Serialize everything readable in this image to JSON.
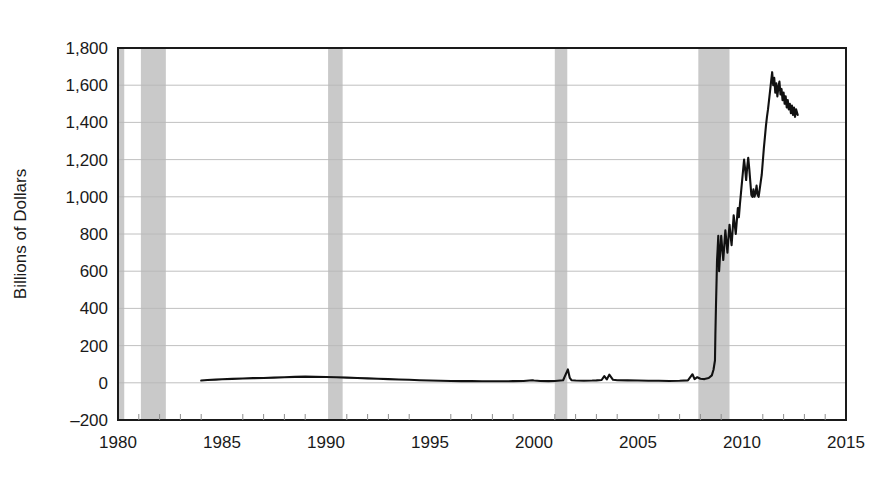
{
  "figure": {
    "name": "excess-reserves-time-series",
    "background_color": "#ffffff"
  },
  "chart_data": {
    "type": "line",
    "title": "",
    "subtitle": "",
    "xlabel": "",
    "ylabel": "Billions of Dollars",
    "xlim": [
      1980,
      2015
    ],
    "ylim": [
      -200,
      1800
    ],
    "ytick_step": 200,
    "xtick_step": 5,
    "grid": "horizontal",
    "legend": "none",
    "line_color": "#111111",
    "line_width": 2.1,
    "recession_band_color": "#c9c9c9",
    "axis_color": "#1a1a1a",
    "gridline_color": "#b9b9b9",
    "xticks": [
      1980,
      1985,
      1990,
      1995,
      2000,
      2005,
      2010,
      2015
    ],
    "xtick_labels": [
      "1980",
      "1985",
      "1990",
      "1995",
      "2000",
      "2005",
      "2010",
      "2015"
    ],
    "yticks": [
      -200,
      0,
      200,
      400,
      600,
      800,
      1000,
      1200,
      1400,
      1600,
      1800
    ],
    "ytick_labels": [
      "–200",
      "0",
      "200",
      "400",
      "600",
      "800",
      "1,000",
      "1,200",
      "1,400",
      "1,600",
      "1,800"
    ],
    "minor_xticks": [
      1981,
      1982,
      1983,
      1984,
      1986,
      1987,
      1988,
      1989,
      1991,
      1992,
      1993,
      1994,
      1996,
      1997,
      1998,
      1999,
      2001,
      2002,
      2003,
      2004,
      2006,
      2007,
      2008,
      2009,
      2011,
      2012,
      2013,
      2014
    ],
    "recession_bands": [
      {
        "name": "recession-1980",
        "start": 1980.0,
        "end": 1980.3
      },
      {
        "name": "recession-1981-1982",
        "start": 1981.1,
        "end": 1982.3
      },
      {
        "name": "recession-1990-1991",
        "start": 1990.1,
        "end": 1990.8
      },
      {
        "name": "recession-2001",
        "start": 2001.0,
        "end": 2001.6
      },
      {
        "name": "recession-2007-2009",
        "start": 2007.9,
        "end": 2009.4
      },
      {
        "name": "recession-edge-left",
        "start": 1980.0,
        "end": 1980.05
      }
    ],
    "series": [
      {
        "name": "Excess Reserves of Depository Institutions",
        "x": [
          1984.0,
          1984.3,
          1984.7,
          1985.0,
          1985.5,
          1986.0,
          1986.5,
          1987.0,
          1987.5,
          1988.0,
          1988.5,
          1989.0,
          1989.5,
          1990.0,
          1990.5,
          1991.0,
          1991.5,
          1992.0,
          1992.5,
          1993.0,
          1993.5,
          1994.0,
          1994.5,
          1995.0,
          1995.5,
          1996.0,
          1996.5,
          1997.0,
          1997.5,
          1998.0,
          1998.5,
          1999.0,
          1999.5,
          1999.92,
          2000.0,
          2000.3,
          2000.7,
          2001.0,
          2001.4,
          2001.63,
          2001.72,
          2001.8,
          2002.0,
          2002.4,
          2002.8,
          2003.0,
          2003.25,
          2003.38,
          2003.5,
          2003.62,
          2003.8,
          2004.0,
          2004.5,
          2005.0,
          2005.5,
          2006.0,
          2006.5,
          2007.0,
          2007.4,
          2007.62,
          2007.72,
          2007.85,
          2008.0,
          2008.2,
          2008.4,
          2008.55,
          2008.63,
          2008.7,
          2008.72,
          2008.75,
          2008.78,
          2008.8,
          2008.83,
          2008.86,
          2008.9,
          2008.95,
          2009.0,
          2009.05,
          2009.1,
          2009.15,
          2009.2,
          2009.25,
          2009.3,
          2009.35,
          2009.4,
          2009.45,
          2009.5,
          2009.55,
          2009.6,
          2009.65,
          2009.7,
          2009.75,
          2009.8,
          2009.85,
          2009.9,
          2009.95,
          2010.0,
          2010.05,
          2010.1,
          2010.15,
          2010.2,
          2010.25,
          2010.3,
          2010.35,
          2010.4,
          2010.45,
          2010.5,
          2010.55,
          2010.6,
          2010.65,
          2010.7,
          2010.75,
          2010.8,
          2010.85,
          2010.9,
          2010.95,
          2011.0,
          2011.05,
          2011.1,
          2011.15,
          2011.2,
          2011.25,
          2011.3,
          2011.35,
          2011.4,
          2011.45,
          2011.5,
          2011.55,
          2011.6,
          2011.65,
          2011.7,
          2011.75,
          2011.8,
          2011.85,
          2011.9,
          2011.95,
          2012.0,
          2012.05,
          2012.1,
          2012.15,
          2012.2,
          2012.25,
          2012.3,
          2012.35,
          2012.4,
          2012.45,
          2012.5,
          2012.55,
          2012.6,
          2012.68
        ],
        "values": [
          12,
          15,
          17,
          19,
          21,
          23,
          25,
          26,
          28,
          30,
          32,
          33,
          32,
          31,
          30,
          28,
          26,
          24,
          22,
          20,
          18,
          16,
          14,
          12,
          11,
          10,
          9,
          9,
          8,
          8,
          8,
          9,
          10,
          14,
          12,
          10,
          9,
          10,
          14,
          72,
          26,
          14,
          12,
          11,
          12,
          13,
          15,
          36,
          18,
          44,
          16,
          14,
          13,
          12,
          11,
          11,
          10,
          11,
          13,
          46,
          20,
          30,
          22,
          20,
          26,
          40,
          70,
          120,
          260,
          420,
          560,
          660,
          720,
          790,
          600,
          700,
          790,
          720,
          660,
          740,
          820,
          760,
          700,
          780,
          850,
          790,
          740,
          820,
          900,
          850,
          800,
          870,
          940,
          890,
          960,
          1020,
          1080,
          1140,
          1200,
          1150,
          1090,
          1160,
          1210,
          1150,
          1080,
          1010,
          1000,
          1040,
          1000,
          1020,
          1060,
          1010,
          1000,
          1040,
          1080,
          1120,
          1190,
          1260,
          1320,
          1380,
          1430,
          1470,
          1520,
          1570,
          1620,
          1670,
          1600,
          1640,
          1560,
          1610,
          1540,
          1590,
          1620,
          1550,
          1580,
          1520,
          1560,
          1500,
          1540,
          1480,
          1520,
          1470,
          1500,
          1450,
          1490,
          1440,
          1480,
          1430,
          1470,
          1440
        ]
      }
    ]
  },
  "axis": {
    "ylabel_text": "Billions of Dollars"
  }
}
